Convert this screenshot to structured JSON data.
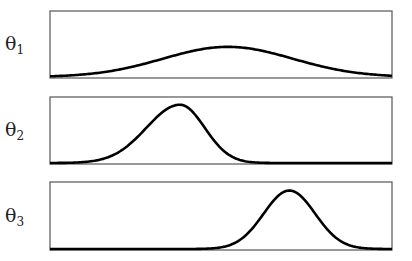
{
  "chart_data": [
    {
      "type": "line",
      "title": "",
      "ylabel": "θ1",
      "label_symbol": "θ",
      "label_sub": "1",
      "distribution": "gaussian",
      "peak_x_fraction": 0.52,
      "peak_height_fraction": 0.45,
      "width_fraction": 0.19,
      "panel": {
        "x": 50,
        "y": 11,
        "w": 342,
        "h": 67
      },
      "grid": false,
      "axis_ticks": false
    },
    {
      "type": "line",
      "title": "",
      "ylabel": "θ2",
      "label_symbol": "θ",
      "label_sub": "2",
      "distribution": "skewed gaussian",
      "peak_x_fraction": 0.38,
      "peak_height_fraction": 0.87,
      "width_fraction": 0.085,
      "panel": {
        "x": 50,
        "y": 97,
        "w": 342,
        "h": 67
      },
      "grid": false,
      "axis_ticks": false
    },
    {
      "type": "line",
      "title": "",
      "ylabel": "θ3",
      "label_symbol": "θ",
      "label_sub": "3",
      "distribution": "gaussian",
      "peak_x_fraction": 0.7,
      "peak_height_fraction": 0.86,
      "width_fraction": 0.075,
      "panel": {
        "x": 50,
        "y": 182,
        "w": 342,
        "h": 68
      },
      "grid": false,
      "axis_ticks": false
    }
  ],
  "colors": {
    "line": "#000000",
    "frame": "#555555",
    "background": "#ffffff"
  }
}
